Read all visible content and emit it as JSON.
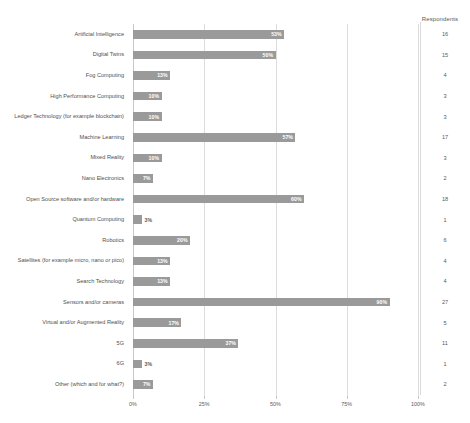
{
  "chart_data": {
    "type": "bar",
    "orientation": "horizontal",
    "title": "",
    "xlabel": "",
    "ylabel": "",
    "xlim": [
      0,
      100
    ],
    "grid": true,
    "legend": "none",
    "axis_tick_labels": [
      "0%",
      "25%",
      "50%",
      "75%",
      "100%"
    ],
    "axis_tick_values": [
      0,
      25,
      50,
      75,
      100
    ],
    "extra_column_header": "Respondents",
    "categories": [
      "Artificial Intelligence",
      "Digital Twins",
      "Fog Computing",
      "High Performance Computing",
      "Ledger Technology (for example blockchain)",
      "Machine Learning",
      "Mixed Reality",
      "Nano Electronics",
      "Open Source software and/or hardware",
      "Quantum Computing",
      "Robotics",
      "Satellites (for example micro, nano or pico)",
      "Search Technology",
      "Sensors and/or cameras",
      "Virtual and/or Augmented Reality",
      "5G",
      "6G",
      "Other (which and for what?)"
    ],
    "values": [
      53,
      50,
      13,
      10,
      10,
      57,
      10,
      7,
      60,
      3,
      20,
      13,
      13,
      90,
      17,
      37,
      3,
      7
    ],
    "value_labels": [
      "53%",
      "50%",
      "13%",
      "10%",
      "10%",
      "57%",
      "10%",
      "7%",
      "60%",
      "3%",
      "20%",
      "13%",
      "13%",
      "90%",
      "17%",
      "37%",
      "3%",
      "7%"
    ],
    "respondents": [
      16,
      15,
      4,
      3,
      3,
      17,
      3,
      2,
      18,
      1,
      6,
      4,
      4,
      27,
      5,
      11,
      1,
      2
    ],
    "bar_color": "#9a9a9a",
    "grid_color": "#dcdcdc",
    "text_color": "#4f4f4f"
  }
}
